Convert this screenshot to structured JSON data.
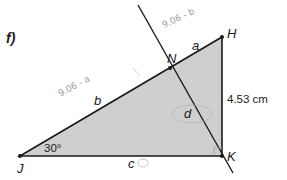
{
  "problem": {
    "part_label": "f)"
  },
  "diagram": {
    "fill_color": "#cfcfcf",
    "line_color": "#1a1a1a",
    "vertices": {
      "J": "J",
      "H": "H",
      "K": "K",
      "N": "N"
    },
    "side_labels": {
      "a": "a",
      "b": "b",
      "c": "c",
      "d": "d"
    },
    "angle_label": "30°",
    "side_HK_length": "4.53 cm"
  },
  "annotations": {
    "handwritten_b": "9.06 - a",
    "handwritten_a": "9.06 - b"
  }
}
